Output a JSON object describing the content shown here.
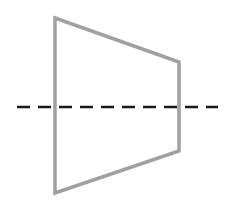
{
  "diagram": {
    "width": 237,
    "height": 208,
    "background": "#ffffff",
    "trapezoid": {
      "points": [
        [
          55,
          18
        ],
        [
          179,
          62
        ],
        [
          179,
          151
        ],
        [
          55,
          193
        ]
      ],
      "stroke": "#a0a0a0",
      "stroke_width": 3.5,
      "fill": "none"
    },
    "axis_line": {
      "x1": 17,
      "y1": 107,
      "x2": 218,
      "y2": 107,
      "stroke": "#1a1a1a",
      "stroke_width": 2.6,
      "dash": "13 8"
    }
  }
}
